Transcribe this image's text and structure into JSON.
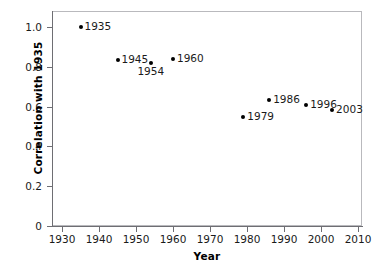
{
  "chart_data": {
    "type": "scatter",
    "title": "",
    "xlabel": "Year",
    "ylabel": "Correlation with 1935",
    "xlim": [
      1925,
      2013
    ],
    "ylim": [
      0,
      1.08
    ],
    "grid": false,
    "legend": null,
    "x_ticks": [
      "1930",
      "1940",
      "1950",
      "1960",
      "1970",
      "1980",
      "1990",
      "2000",
      "2010"
    ],
    "x_tick_values": [
      1930,
      1940,
      1950,
      1960,
      1970,
      1980,
      1990,
      2000,
      2010
    ],
    "y_ticks": [
      "0",
      "0.2",
      "0.4",
      "0.6",
      "0.8",
      "1.0"
    ],
    "y_tick_values": [
      0,
      0.2,
      0.4,
      0.6,
      0.8,
      1.0
    ],
    "marker": "filled-circle",
    "marker_color": "#000000",
    "points": [
      {
        "label": "1935",
        "x": 1935,
        "y": 1.0,
        "label_pos": "right"
      },
      {
        "label": "1945",
        "x": 1945,
        "y": 0.835,
        "label_pos": "right"
      },
      {
        "label": "1954",
        "x": 1954,
        "y": 0.82,
        "label_pos": "below"
      },
      {
        "label": "1960",
        "x": 1960,
        "y": 0.84,
        "label_pos": "right"
      },
      {
        "label": "1979",
        "x": 1979,
        "y": 0.55,
        "label_pos": "right"
      },
      {
        "label": "1986",
        "x": 1986,
        "y": 0.635,
        "label_pos": "right"
      },
      {
        "label": "1996",
        "x": 1996,
        "y": 0.61,
        "label_pos": "right"
      },
      {
        "label": "2003",
        "x": 2003,
        "y": 0.585,
        "label_pos": "right"
      }
    ]
  },
  "colors": {
    "background": "#ffffff",
    "axis": "#6e6e73",
    "frame": "#b9b9bd",
    "text": "#1a1a1a",
    "marker": "#000000"
  }
}
